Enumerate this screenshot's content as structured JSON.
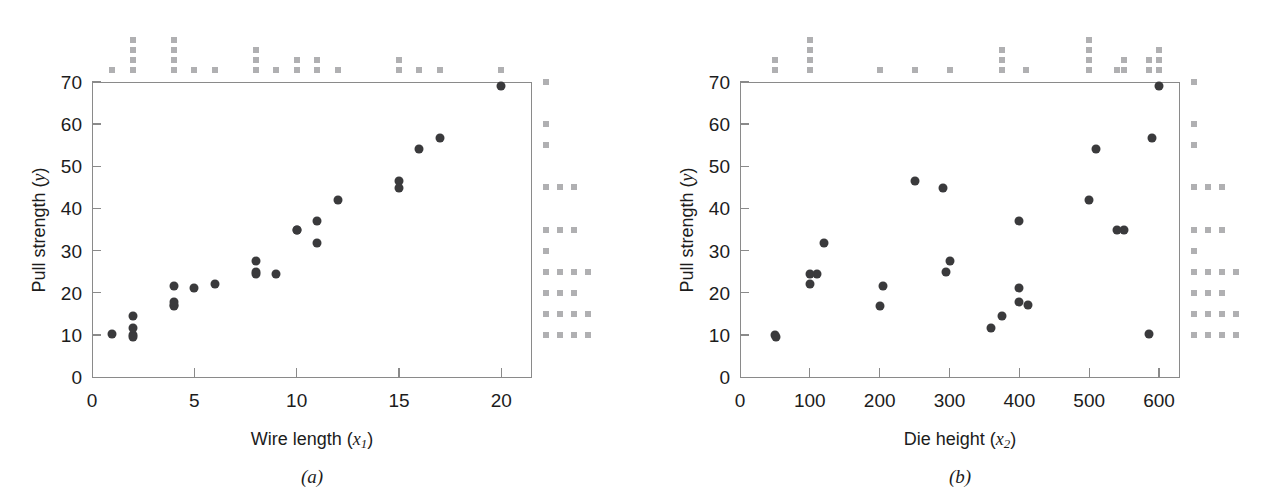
{
  "figure": {
    "panels": [
      {
        "id": "a",
        "caption": "(a)",
        "x_axis_label": "Wire length",
        "x_axis_symbol": "x",
        "x_axis_subscript": "1",
        "y_axis_label": "Pull strength",
        "y_axis_symbol": "y",
        "x_ticks": [
          0,
          5,
          10,
          15,
          20
        ],
        "y_ticks": [
          0,
          10,
          20,
          30,
          40,
          50,
          60,
          70
        ],
        "x_range": [
          0,
          21.5
        ],
        "y_range": [
          0,
          70
        ]
      },
      {
        "id": "b",
        "caption": "(b)",
        "x_axis_label": "Die height",
        "x_axis_symbol": "x",
        "x_axis_subscript": "2",
        "y_axis_label": "Pull strength",
        "y_axis_symbol": "y",
        "x_ticks": [
          0,
          100,
          200,
          300,
          400,
          500,
          600
        ],
        "y_ticks": [
          0,
          10,
          20,
          30,
          40,
          50,
          60,
          70
        ],
        "x_range": [
          0,
          630
        ],
        "y_range": [
          0,
          70
        ]
      }
    ],
    "marker_color": "#3a3a3c",
    "rug_color": "#b0b0b2",
    "axis_color": "#8a8a8a"
  },
  "chart_data": [
    {
      "type": "scatter",
      "panel": "a",
      "title": "",
      "xlabel": "Wire length (x1)",
      "ylabel": "Pull strength (y)",
      "xlim": [
        0,
        21.5
      ],
      "ylim": [
        0,
        70
      ],
      "xticks": [
        0,
        5,
        10,
        15,
        20
      ],
      "yticks": [
        0,
        10,
        20,
        30,
        40,
        50,
        60,
        70
      ],
      "grid": false,
      "legend": "none",
      "x": [
        2,
        8,
        11,
        10,
        8,
        4,
        2,
        2,
        9,
        8,
        4,
        11,
        12,
        2,
        4,
        4,
        20,
        1,
        10,
        15,
        15,
        16,
        17,
        6,
        5
      ],
      "y": [
        9.95,
        24.45,
        31.75,
        35.0,
        25.02,
        16.86,
        14.38,
        9.6,
        24.35,
        27.5,
        17.08,
        37.0,
        41.95,
        11.66,
        21.65,
        17.89,
        69.0,
        10.3,
        34.93,
        46.59,
        44.88,
        54.12,
        56.63,
        22.13,
        21.15
      ],
      "marginal_x_counts": {
        "1": 1,
        "2": 4,
        "4": 4,
        "5": 1,
        "6": 1,
        "8": 3,
        "9": 1,
        "10": 2,
        "11": 2,
        "12": 1,
        "15": 2,
        "16": 1,
        "17": 1,
        "20": 1
      },
      "marginal_y_bins": [
        {
          "bin": 10,
          "count": 4
        },
        {
          "bin": 15,
          "count": 4
        },
        {
          "bin": 20,
          "count": 3
        },
        {
          "bin": 25,
          "count": 4
        },
        {
          "bin": 30,
          "count": 1
        },
        {
          "bin": 35,
          "count": 3
        },
        {
          "bin": 45,
          "count": 3
        },
        {
          "bin": 55,
          "count": 1
        },
        {
          "bin": 60,
          "count": 1
        },
        {
          "bin": 70,
          "count": 1
        }
      ]
    },
    {
      "type": "scatter",
      "panel": "b",
      "title": "",
      "xlabel": "Die height (x2)",
      "ylabel": "Pull strength (y)",
      "xlim": [
        0,
        630
      ],
      "ylim": [
        0,
        70
      ],
      "xticks": [
        0,
        100,
        200,
        300,
        400,
        500,
        600
      ],
      "yticks": [
        0,
        10,
        20,
        30,
        40,
        50,
        60,
        70
      ],
      "grid": false,
      "legend": "none",
      "x": [
        50,
        110,
        120,
        550,
        295,
        200,
        375,
        52,
        100,
        300,
        412,
        400,
        500,
        360,
        205,
        400,
        600,
        585,
        540,
        250,
        290,
        510,
        590,
        100,
        400
      ],
      "y": [
        9.95,
        24.45,
        31.75,
        35.0,
        25.02,
        16.86,
        14.38,
        9.6,
        24.35,
        27.5,
        17.08,
        37.0,
        41.95,
        11.66,
        21.65,
        17.89,
        69.0,
        10.3,
        34.93,
        46.59,
        44.88,
        54.12,
        56.63,
        22.13,
        21.15
      ],
      "marginal_x_counts": {
        "50": 2,
        "100": 4,
        "200": 1,
        "250": 1,
        "300": 1,
        "375": 3,
        "410": 1,
        "500": 4,
        "540": 1,
        "550": 2,
        "585": 2,
        "600": 3
      },
      "marginal_y_bins": [
        {
          "bin": 10,
          "count": 4
        },
        {
          "bin": 15,
          "count": 4
        },
        {
          "bin": 20,
          "count": 3
        },
        {
          "bin": 25,
          "count": 4
        },
        {
          "bin": 30,
          "count": 1
        },
        {
          "bin": 35,
          "count": 3
        },
        {
          "bin": 45,
          "count": 3
        },
        {
          "bin": 55,
          "count": 1
        },
        {
          "bin": 60,
          "count": 1
        },
        {
          "bin": 70,
          "count": 1
        }
      ]
    }
  ]
}
